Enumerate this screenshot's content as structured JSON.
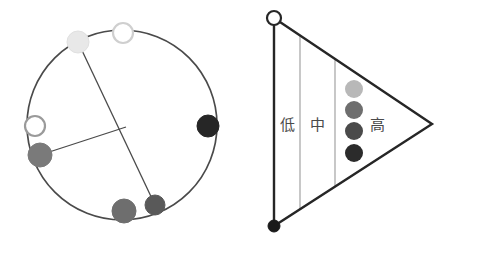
{
  "figure": {
    "background_color": "#ffffff",
    "stroke_color": "#4a4a4a",
    "dark_stroke_color": "#262626",
    "divider_color": "#9a9a9a",
    "panels": [
      {
        "id": "circle-panel",
        "name": "circular-network-diagram",
        "shape": "circle",
        "center": {
          "x": 122,
          "y": 125
        },
        "radius": 95,
        "nodes": [
          {
            "id": "node-light",
            "name": "node-very-light",
            "x": 78,
            "y": 42,
            "r": 11,
            "fill": "#e8e8e8",
            "stroke": "#e0e0e0",
            "style": "filled"
          },
          {
            "id": "node-open-top",
            "name": "node-open-top",
            "x": 123,
            "y": 33,
            "r": 10,
            "fill": "#ffffff",
            "stroke": "#cfcfcf",
            "style": "open"
          },
          {
            "id": "node-black-right",
            "name": "node-black-right",
            "x": 208,
            "y": 126,
            "r": 11,
            "fill": "#262626",
            "stroke": "#262626",
            "style": "filled"
          },
          {
            "id": "node-dark-bottom",
            "name": "node-dark-gray-bottom",
            "x": 155,
            "y": 205,
            "r": 10,
            "fill": "#595959",
            "stroke": "#595959",
            "style": "filled"
          },
          {
            "id": "node-mid-bottom",
            "name": "node-mid-gray-bottom",
            "x": 124,
            "y": 211,
            "r": 12,
            "fill": "#6e6e6e",
            "stroke": "#6e6e6e",
            "style": "filled"
          },
          {
            "id": "node-mid-left",
            "name": "node-mid-gray-left",
            "x": 40,
            "y": 155,
            "r": 12,
            "fill": "#7a7a7a",
            "stroke": "#7a7a7a",
            "style": "filled"
          },
          {
            "id": "node-open-left",
            "name": "node-open-left",
            "x": 35,
            "y": 126,
            "r": 10,
            "fill": "#ffffff",
            "stroke": "#9a9a9a",
            "style": "open"
          }
        ],
        "chords": [
          {
            "id": "chord-main",
            "name": "chord-light-to-dark",
            "x1": 78,
            "y1": 42,
            "x2": 155,
            "y2": 205
          },
          {
            "id": "chord-branch",
            "name": "chord-left-to-junction",
            "x1": 40,
            "y1": 155,
            "x2": 126,
            "y2": 127
          }
        ],
        "junction": {
          "name": "chord-junction-point",
          "x": 126,
          "y": 127
        }
      },
      {
        "id": "triangle-panel",
        "name": "triangular-gradient-diagram",
        "shape": "triangle",
        "vertices": {
          "top_left": {
            "x": 274,
            "y": 18
          },
          "bottom_left": {
            "x": 274,
            "y": 226
          },
          "apex_right": {
            "x": 432,
            "y": 124
          }
        },
        "vertex_markers": [
          {
            "id": "vertex-open",
            "name": "triangle-vertex-open-top",
            "x": 274,
            "y": 18,
            "r": 7,
            "fill": "#ffffff",
            "stroke": "#262626",
            "style": "open"
          },
          {
            "id": "vertex-filled",
            "name": "triangle-vertex-filled-bottom",
            "x": 274,
            "y": 226,
            "r": 6,
            "fill": "#1a1a1a",
            "stroke": "#1a1a1a",
            "style": "filled"
          }
        ],
        "dividers": [
          {
            "id": "divider-1",
            "name": "band-divider-left",
            "x": 300
          },
          {
            "id": "divider-2",
            "name": "band-divider-right",
            "x": 335
          }
        ],
        "band_labels": [
          {
            "id": "label-low",
            "name": "band-label-low",
            "text": "低",
            "meaning": "low",
            "x": 287,
            "y": 125
          },
          {
            "id": "label-mid",
            "name": "band-label-medium",
            "text": "中",
            "meaning": "medium",
            "x": 317,
            "y": 125
          },
          {
            "id": "label-high",
            "name": "band-label-high",
            "text": "高",
            "meaning": "high",
            "x": 377,
            "y": 125
          }
        ],
        "gradient_dots": [
          {
            "id": "dot-1",
            "name": "gradient-dot-lightest",
            "x": 354,
            "y": 89,
            "r": 9,
            "fill": "#b8b8b8"
          },
          {
            "id": "dot-2",
            "name": "gradient-dot-light",
            "x": 354,
            "y": 110,
            "r": 9,
            "fill": "#6e6e6e"
          },
          {
            "id": "dot-3",
            "name": "gradient-dot-dark",
            "x": 354,
            "y": 131,
            "r": 9,
            "fill": "#4a4a4a"
          },
          {
            "id": "dot-4",
            "name": "gradient-dot-darkest",
            "x": 354,
            "y": 153,
            "r": 9,
            "fill": "#2b2b2b"
          }
        ]
      }
    ]
  }
}
